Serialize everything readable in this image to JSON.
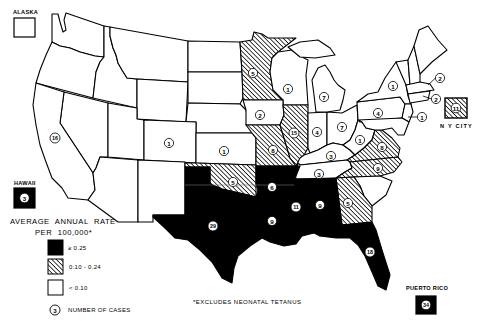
{
  "insets": {
    "alaska": {
      "label": "ALASKA",
      "category": "low"
    },
    "hawaii": {
      "label": "HAWAII",
      "category": "high",
      "cases": "3"
    },
    "puerto_rico": {
      "label": "PUERTO RICO",
      "category": "high",
      "cases": "34"
    },
    "ny_city": {
      "label": "N Y CITY",
      "category": "mid",
      "cases": "11"
    }
  },
  "legend": {
    "title_line1": "AVERAGE ANNUAL RATE",
    "title_line2": "PER 100,000*",
    "items": [
      {
        "category": "high",
        "label": "≥ 0.25"
      },
      {
        "category": "mid",
        "label": "0.10 - 0.24"
      },
      {
        "category": "low",
        "label": "< 0.10"
      }
    ],
    "cases_marker": {
      "sample": "3",
      "label": "NUMBER OF CASES"
    }
  },
  "footnote": "*EXCLUDES NEONATAL TETANUS",
  "colors": {
    "high": "#000000",
    "mid": "hatched",
    "low": "#ffffff",
    "outline": "#000000"
  },
  "states": [
    {
      "id": "WA",
      "category": "low",
      "points": "52,14 58,14 60,22 63,32 66,30 64,20 66,13 104,26 104,57 95,56 80,52 70,48 60,46 52,42"
    },
    {
      "id": "OR",
      "category": "low",
      "points": "52,42 60,46 70,48 80,52 95,56 104,57 100,62 96,72 93,98 36,83 40,70 46,55"
    },
    {
      "id": "ID",
      "category": "low",
      "points": "104,26 110,27 110,36 113,48 116,55 118,63 122,70 127,78 137,79 137,108 93,98 96,72 100,62 104,57"
    },
    {
      "id": "MT",
      "category": "low",
      "points": "110,27 188,41 188,82 137,79 127,78 122,70 118,63 116,55 113,48 110,36"
    },
    {
      "id": "WY",
      "category": "low",
      "points": "137,79 188,82 186,122 137,119"
    },
    {
      "id": "ND",
      "category": "low",
      "points": "188,41 240,42 242,72 188,72"
    },
    {
      "id": "SD",
      "category": "low",
      "points": "188,72 242,72 243,98 240,104 188,103"
    },
    {
      "id": "NE",
      "category": "low",
      "points": "188,103 240,104 246,110 252,133 196,133 196,122 186,122"
    },
    {
      "id": "NV",
      "category": "low",
      "points": "64,92 108,103 108,157 100,157 96,168 93,173 60,123"
    },
    {
      "id": "UT",
      "category": "low",
      "points": "108,103 137,108 137,119 144,120 144,160 108,157"
    },
    {
      "id": "CO",
      "category": "low",
      "cases": "1",
      "label_xy": [
        169,
        143
      ],
      "points": "144,120 196,122 196,163 144,160"
    },
    {
      "id": "CA",
      "category": "low",
      "cases": "16",
      "label_xy": [
        55,
        138
      ],
      "points": "36,83 64,92 60,123 93,173 95,190 88,200 68,198 62,188 52,178 46,162 40,145 36,125 33,105"
    },
    {
      "id": "AZ",
      "category": "low",
      "points": "100,157 138,160 138,222 118,222 88,200 95,190 93,173 96,168"
    },
    {
      "id": "NM",
      "category": "low",
      "points": "138,160 185,162 185,215 153,215 153,222 138,222"
    },
    {
      "id": "KS",
      "category": "low",
      "cases": "1",
      "label_xy": [
        224,
        151
      ],
      "points": "196,133 252,133 256,138 256,165 196,163"
    },
    {
      "id": "OK",
      "category": "mid",
      "cases": "5",
      "label_xy": [
        233,
        182
      ],
      "points": "185,163 196,163 256,165 256,197 248,195 235,192 222,189 210,184 210,167 185,167"
    },
    {
      "id": "TX",
      "category": "high",
      "cases": "29",
      "label_xy": [
        213,
        226
      ],
      "points": "185,167 210,167 210,184 222,189 235,192 248,195 256,197 258,220 262,238 250,246 238,256 234,268 232,283 222,278 212,262 200,250 188,240 175,238 165,228 153,217 153,215 185,215"
    },
    {
      "id": "MN",
      "category": "mid",
      "cases": "5",
      "label_xy": [
        253,
        73
      ],
      "points": "240,42 252,40 254,32 262,34 268,38 296,38 278,52 272,58 270,72 273,90 283,100 243,100 242,72"
    },
    {
      "id": "WI",
      "category": "low",
      "cases": "1",
      "label_xy": [
        288,
        89
      ],
      "points": "278,52 292,50 300,56 308,60 306,75 308,105 283,105 283,100 273,90 270,72 272,58"
    },
    {
      "id": "IA",
      "category": "low",
      "cases": "2",
      "label_xy": [
        260,
        115
      ],
      "points": "243,100 283,100 283,105 284,115 280,125 246,125 246,110"
    },
    {
      "id": "MO",
      "category": "mid",
      "cases": "8",
      "label_xy": [
        273,
        150
      ],
      "points": "246,125 280,125 284,138 290,158 296,166 256,166 256,138 252,133"
    },
    {
      "id": "IL",
      "category": "mid",
      "cases": "15",
      "label_xy": [
        294,
        133
      ],
      "points": "283,105 308,105 308,148 304,155 298,163 296,166 290,158 284,138 280,125 284,115"
    },
    {
      "id": "IN",
      "category": "low",
      "cases": "4",
      "label_xy": [
        317,
        132
      ],
      "points": "308,113 327,112 327,145 318,150 310,153 308,148"
    },
    {
      "id": "OH",
      "category": "low",
      "cases": "7",
      "label_xy": [
        342,
        127
      ],
      "points": "327,112 342,113 357,105 358,120 355,130 350,140 343,145 333,143 327,145"
    },
    {
      "id": "MI-UP",
      "category": "low",
      "points": "288,47 300,42 318,40 330,48 335,55 315,58 300,57"
    },
    {
      "id": "MI",
      "category": "low",
      "cases": "7",
      "label_xy": [
        324,
        97
      ],
      "points": "312,80 318,68 325,65 330,72 334,80 338,85 345,90 343,100 340,110 327,112 316,112 314,95"
    },
    {
      "id": "KY",
      "category": "low",
      "cases": "3",
      "label_xy": [
        331,
        156
      ],
      "points": "296,166 300,158 304,155 310,153 318,150 327,145 333,143 343,145 350,150 355,155 347,160 300,165"
    },
    {
      "id": "WV",
      "category": "low",
      "cases": "1",
      "label_xy": [
        360,
        140
      ],
      "points": "343,145 350,140 355,130 358,120 362,122 366,128 375,130 372,140 364,148 355,155 350,150"
    },
    {
      "id": "VA",
      "category": "mid",
      "cases": "8",
      "label_xy": [
        382,
        147
      ],
      "points": "355,155 364,148 372,140 375,130 382,130 392,138 400,148 398,157 350,162 347,160"
    },
    {
      "id": "PA",
      "category": "low",
      "cases": "4",
      "label_xy": [
        378,
        113
      ],
      "points": "357,102 400,97 405,104 402,118 360,122 358,120"
    },
    {
      "id": "NY",
      "category": "low",
      "cases": "1",
      "label_xy": [
        393,
        86
      ],
      "points": "357,102 368,94 378,92 385,78 396,62 402,62 406,85 408,96 411,104 405,104 400,97"
    },
    {
      "id": "NJ",
      "category": "low",
      "cases": "1",
      "label_xy": [
        422,
        117
      ],
      "leader_to": [
        408,
        117
      ],
      "points": "405,104 411,104 413,112 409,122 402,118"
    },
    {
      "id": "MD-DE",
      "category": "low",
      "points": "358,120 402,118 409,122 404,135 398,135 392,128 382,130 375,130 366,128 362,122"
    },
    {
      "id": "VT",
      "category": "low",
      "points": "396,62 408,60 410,85 406,85"
    },
    {
      "id": "NH",
      "category": "low",
      "points": "408,60 414,46 420,74 420,82 410,85"
    },
    {
      "id": "ME",
      "category": "low",
      "points": "414,46 419,30 428,26 438,40 447,50 432,62 420,74"
    },
    {
      "id": "MA",
      "category": "low",
      "cases": "2",
      "label_xy": [
        440,
        78
      ],
      "leader_to": [
        428,
        85
      ],
      "points": "406,85 420,82 430,84 434,90 408,94"
    },
    {
      "id": "CT-RI",
      "category": "low",
      "cases": "2",
      "label_xy": [
        436,
        99
      ],
      "leader_to": [
        423,
        96
      ],
      "points": "408,94 430,91 428,100 410,103"
    },
    {
      "id": "TN",
      "category": "low",
      "cases": "3",
      "label_xy": [
        319,
        174
      ],
      "points": "298,163 300,165 347,160 350,162 352,168 345,172 336,178 294,179 296,170"
    },
    {
      "id": "NC",
      "category": "mid",
      "cases": "9",
      "label_xy": [
        378,
        168
      ],
      "points": "350,162 398,157 402,162 394,172 380,176 354,177 336,178 345,172 352,168"
    },
    {
      "id": "SC",
      "category": "low",
      "points": "354,177 380,176 392,181 386,195 372,206 364,196 360,186"
    },
    {
      "id": "GA",
      "category": "mid",
      "cases": "5",
      "label_xy": [
        348,
        203
      ],
      "points": "336,178 354,177 360,186 364,196 372,206 372,222 342,225"
    },
    {
      "id": "AL",
      "category": "high",
      "cases": "9",
      "label_xy": [
        320,
        205
      ],
      "points": "314,179 336,178 342,225 322,228 320,236 314,233"
    },
    {
      "id": "MS",
      "category": "high",
      "cases": "11",
      "label_xy": [
        296,
        207
      ],
      "points": "294,179 314,179 314,233 302,236 298,222 292,206 294,190"
    },
    {
      "id": "AR",
      "category": "high",
      "cases": "6",
      "label_xy": [
        272,
        187
      ],
      "points": "256,166 300,166 296,176 294,190 258,190 256,184"
    },
    {
      "id": "LA",
      "category": "high",
      "cases": "9",
      "label_xy": [
        272,
        221
      ],
      "points": "258,190 294,190 292,206 298,222 302,236 296,244 284,246 270,242 262,238 258,220 256,197"
    },
    {
      "id": "FL",
      "category": "high",
      "cases": "18",
      "label_xy": [
        370,
        252
      ],
      "points": "320,236 322,228 342,225 372,222 376,230 382,250 390,275 386,290 378,286 372,272 365,256 358,245 350,238 336,238"
    }
  ]
}
